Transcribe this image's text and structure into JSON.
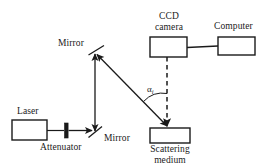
{
  "figure": {
    "type": "optical-setup-schematic",
    "background_color": "#ffffff",
    "stroke_color": "#1a1a1a"
  },
  "labels": {
    "laser": "Laser",
    "attenuator": "Attenuator",
    "mirror_lower": "Mirror",
    "mirror_upper": "Mirror",
    "ccd_camera_line1": "CCD",
    "ccd_camera_line2": "camera",
    "computer": "Computer",
    "scattering_line1": "Scattering",
    "scattering_line2": "medium",
    "angle_symbol": "α",
    "angle_subscript": "i"
  },
  "components": [
    {
      "name": "laser-box",
      "label": "Laser",
      "x": 12,
      "y": 120,
      "w": 35,
      "h": 20,
      "shape": "rectangle"
    },
    {
      "name": "attenuator-element",
      "label": "Attenuator",
      "x": 65,
      "y": 123,
      "w": 4,
      "h": 14,
      "shape": "bar"
    },
    {
      "name": "mirror-lower",
      "label": "Mirror",
      "x": 95,
      "y": 132,
      "shape": "diagonal-line"
    },
    {
      "name": "mirror-upper",
      "label": "Mirror",
      "x": 95,
      "y": 52,
      "shape": "diagonal-line"
    },
    {
      "name": "ccd-camera-box",
      "label": "CCD camera",
      "x": 150,
      "y": 37,
      "w": 37,
      "h": 20,
      "shape": "rectangle"
    },
    {
      "name": "computer-box",
      "label": "Computer",
      "x": 218,
      "y": 37,
      "w": 37,
      "h": 18,
      "shape": "rectangle"
    },
    {
      "name": "scattering-medium-box",
      "label": "Scattering medium",
      "x": 150,
      "y": 128,
      "w": 40,
      "h": 15,
      "shape": "rectangle"
    }
  ],
  "connections": [
    {
      "name": "laser-to-attenuator",
      "style": "solid",
      "from": "laser-box",
      "to": "attenuator-element"
    },
    {
      "name": "attenuator-to-lower-mirror",
      "style": "solid-arrow",
      "from": "attenuator-element",
      "to": "mirror-lower"
    },
    {
      "name": "lower-mirror-to-upper-mirror",
      "style": "double-arrow-vertical",
      "from": "mirror-lower",
      "to": "mirror-upper"
    },
    {
      "name": "upper-mirror-to-scattering-medium",
      "style": "double-arrow-diagonal",
      "from": "mirror-upper",
      "to": "scattering-medium-box"
    },
    {
      "name": "scattering-medium-to-ccd-camera",
      "style": "dashed-arrow",
      "from": "ccd-camera-box",
      "to": "scattering-medium-box"
    },
    {
      "name": "ccd-camera-to-computer",
      "style": "solid",
      "from": "ccd-camera-box",
      "to": "computer-box"
    }
  ],
  "annotations": [
    {
      "name": "incidence-angle",
      "symbol": "α",
      "subscript": "i",
      "x": 148,
      "y": 86
    }
  ]
}
